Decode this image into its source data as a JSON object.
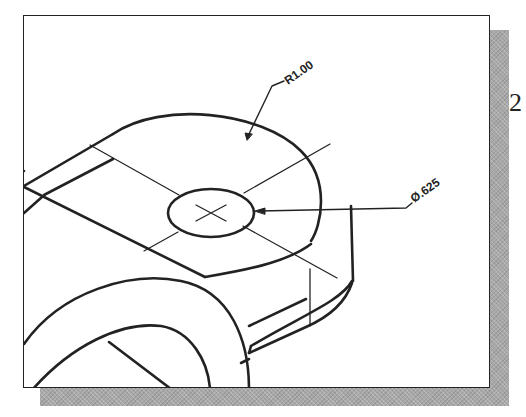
{
  "figure": {
    "type": "isometric-view",
    "dimensions": {
      "radius_label": "R1.00",
      "hole_diameter_label": "Ø.625"
    },
    "side_marker": "2"
  },
  "colors": {
    "line": "#222222",
    "shadow": "#a8a8a8",
    "background": "#ffffff"
  }
}
